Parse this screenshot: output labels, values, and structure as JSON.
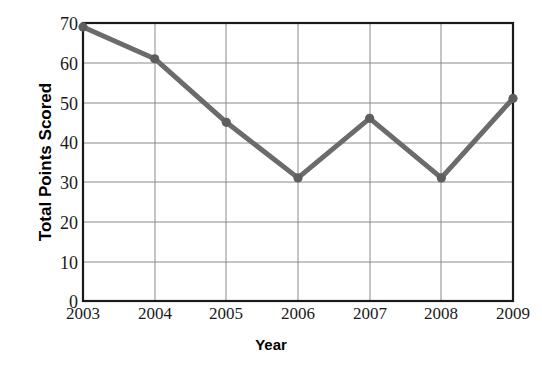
{
  "chart_data": {
    "type": "line",
    "title": "",
    "xlabel": "Year",
    "ylabel": "Total Points Scored",
    "categories": [
      "2003",
      "2004",
      "2005",
      "2006",
      "2007",
      "2008",
      "2009"
    ],
    "x": [
      2003,
      2004,
      2005,
      2006,
      2007,
      2008,
      2009
    ],
    "values": [
      69,
      61,
      45,
      31,
      46,
      31,
      51
    ],
    "series": [
      {
        "name": "Total Points Scored",
        "values": [
          69,
          61,
          45,
          31,
          46,
          31,
          51
        ]
      }
    ],
    "xlim": [
      2003,
      2009
    ],
    "ylim": [
      0,
      70
    ],
    "yticks": [
      0,
      10,
      20,
      30,
      40,
      50,
      60,
      70
    ],
    "ytick_labels": [
      "0",
      "10",
      "20",
      "30",
      "40",
      "50",
      "60",
      "70"
    ],
    "xticks": [
      2003,
      2004,
      2005,
      2006,
      2007,
      2008,
      2009
    ],
    "xtick_labels": [
      "2003",
      "2004",
      "2005",
      "2006",
      "2007",
      "2008",
      "2009"
    ],
    "grid": true,
    "grid_axes": "both",
    "legend": false,
    "legend_position": "none",
    "marker": "circle",
    "line_color": "#6b6b6b",
    "marker_color": "#5e5e5e",
    "grid_color": "#8a8a8a",
    "frame_color": "#1a1a1a",
    "background_color": "#ffffff",
    "line_width": 5
  }
}
